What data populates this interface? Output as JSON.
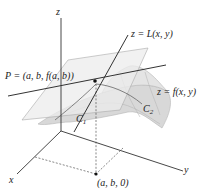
{
  "diagram": {
    "type": "3d-tangent-plane",
    "axes": {
      "x_label": "x",
      "y_label": "y",
      "z_label": "z"
    },
    "labels": {
      "tangent_plane": "z = L(x, y)",
      "surface": "z = f(x, y)",
      "point_P": "P = (a, b, f(a, b))",
      "base_point": "(a, b, 0)",
      "curve_1": "C",
      "curve_1_sub": "1",
      "curve_2": "C",
      "curve_2_sub": "2"
    },
    "colors": {
      "surface_fill": "#d6d6d6",
      "plane_fill": "#eeeeee",
      "lines": "#333333",
      "dashed": "#555555"
    }
  }
}
